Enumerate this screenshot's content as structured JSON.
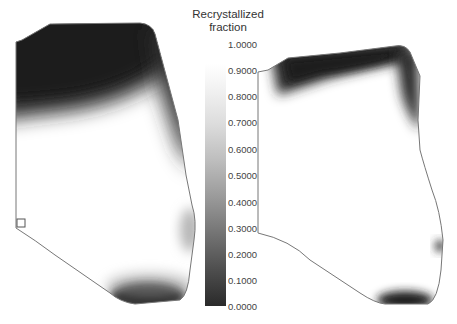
{
  "colorbar": {
    "title_line1": "Recrystallized",
    "title_line2": "fraction",
    "ticks": [
      "1.0000",
      "0.9000",
      "0.8000",
      "0.7000",
      "0.6000",
      "0.5000",
      "0.4000",
      "0.3000",
      "0.2000",
      "0.1000",
      "0.0000"
    ],
    "colormap": "grayscale (white = 1.0, black = 0.0)"
  },
  "panels": [
    {
      "name": "left-specimen",
      "description": "Cross-section with unrecrystallized (dark) top region, gradient transition to fully recrystallized (white) middle, dark zone at bottom tip, light gray patch on right edge, small square marker on left edge"
    },
    {
      "name": "right-specimen",
      "description": "Cross-section mostly recrystallized (white), dark band along top edge and top-right corner, small dark spot on right edge, dark zone at bottom"
    }
  ]
}
